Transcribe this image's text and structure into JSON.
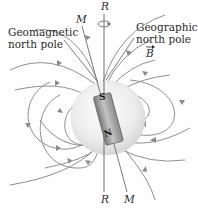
{
  "diagram": {
    "labels": {
      "geomagnetic_north_pole_line1": "Geomagnetic",
      "geomagnetic_north_pole_line2": "north pole",
      "geographic_north_pole_line1": "Geographic",
      "geographic_north_pole_line2": "north pole",
      "magnetic_axis_top": "M",
      "rotation_axis_top": "R",
      "field_vector": "B",
      "rotation_axis_bottom": "R",
      "magnetic_axis_bottom": "M"
    },
    "magnet": {
      "south_label": "S",
      "north_label": "N"
    },
    "colors": {
      "field_lines": "#8a8a8a",
      "sphere": "#e6e6e6",
      "magnet_body": "#9a9a9a",
      "text": "#2a2a2a"
    }
  }
}
